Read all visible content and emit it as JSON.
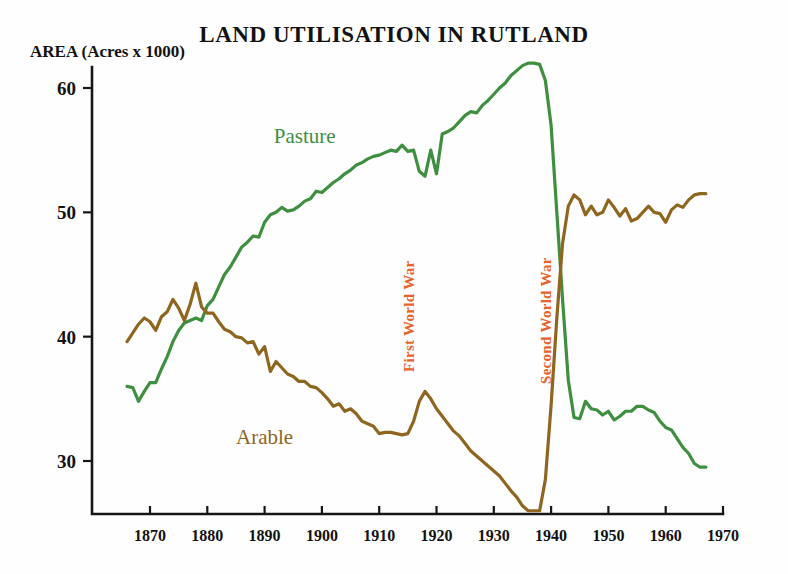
{
  "chart_data": {
    "type": "line",
    "title": "LAND UTILISATION IN RUTLAND",
    "ylabel": "AREA (Acres x 1000)",
    "xlabel": "",
    "xlim": [
      1866,
      1970
    ],
    "ylim": [
      24,
      63
    ],
    "grid": false,
    "legend_position": "inline-labels",
    "x_ticks": [
      1870,
      1880,
      1890,
      1900,
      1910,
      1920,
      1930,
      1940,
      1950,
      1960,
      1970
    ],
    "y_ticks": [
      30,
      40,
      50,
      60
    ],
    "colors": {
      "pasture": "#3e8f3f",
      "arable": "#8f6620",
      "annotation": "#e8622a",
      "axis": "#161616"
    },
    "annotations": [
      {
        "label": "First World War",
        "x": 1916,
        "orientation": "vertical"
      },
      {
        "label": "Second World War",
        "x": 1940,
        "orientation": "vertical"
      }
    ],
    "series": [
      {
        "name": "Pasture",
        "color": "#3e8f3f",
        "label_x": 1897,
        "label_y": 55.6,
        "x": [
          1866,
          1867,
          1868,
          1869,
          1870,
          1871,
          1872,
          1873,
          1874,
          1875,
          1876,
          1877,
          1878,
          1879,
          1880,
          1881,
          1882,
          1883,
          1884,
          1885,
          1886,
          1887,
          1888,
          1889,
          1890,
          1891,
          1892,
          1893,
          1894,
          1895,
          1896,
          1897,
          1898,
          1899,
          1900,
          1901,
          1902,
          1903,
          1904,
          1905,
          1906,
          1907,
          1908,
          1909,
          1910,
          1911,
          1912,
          1913,
          1914,
          1915,
          1916,
          1917,
          1918,
          1919,
          1920,
          1921,
          1922,
          1923,
          1924,
          1925,
          1926,
          1927,
          1928,
          1929,
          1930,
          1931,
          1932,
          1933,
          1934,
          1935,
          1936,
          1937,
          1938,
          1939,
          1940,
          1941,
          1942,
          1943,
          1944,
          1945,
          1946,
          1947,
          1948,
          1949,
          1950,
          1951,
          1952,
          1953,
          1954,
          1955,
          1956,
          1957,
          1958,
          1959,
          1960,
          1961,
          1962,
          1963,
          1964,
          1965,
          1966,
          1967
        ],
        "y": [
          36.0,
          35.9,
          34.8,
          35.6,
          36.3,
          36.3,
          37.4,
          38.4,
          39.6,
          40.5,
          41.1,
          41.3,
          41.5,
          41.3,
          42.5,
          43.0,
          44.0,
          45.0,
          45.6,
          46.4,
          47.2,
          47.6,
          48.1,
          48.0,
          49.2,
          49.8,
          50.0,
          50.4,
          50.1,
          50.2,
          50.5,
          50.9,
          51.1,
          51.7,
          51.6,
          52.0,
          52.4,
          52.7,
          53.1,
          53.4,
          53.8,
          54.0,
          54.3,
          54.5,
          54.6,
          54.8,
          55.0,
          54.9,
          55.4,
          54.9,
          55.0,
          53.3,
          52.9,
          55.0,
          53.1,
          56.3,
          56.5,
          56.8,
          57.3,
          57.8,
          58.1,
          58.0,
          58.6,
          59.0,
          59.5,
          60.0,
          60.4,
          61.0,
          61.4,
          61.8,
          62.0,
          62.0,
          61.9,
          60.6,
          57.0,
          50.0,
          43.0,
          36.5,
          33.5,
          33.4,
          34.8,
          34.2,
          34.1,
          33.7,
          34.0,
          33.3,
          33.6,
          34.0,
          34.0,
          34.4,
          34.4,
          34.1,
          33.9,
          33.2,
          32.7,
          32.5,
          31.8,
          31.1,
          30.6,
          29.8,
          29.5,
          29.5
        ]
      },
      {
        "name": "Arable",
        "color": "#8f6620",
        "label_x": 1890,
        "label_y": 31.4,
        "x": [
          1866,
          1867,
          1868,
          1869,
          1870,
          1871,
          1872,
          1873,
          1874,
          1875,
          1876,
          1877,
          1878,
          1879,
          1880,
          1881,
          1882,
          1883,
          1884,
          1885,
          1886,
          1887,
          1888,
          1889,
          1890,
          1891,
          1892,
          1893,
          1894,
          1895,
          1896,
          1897,
          1898,
          1899,
          1900,
          1901,
          1902,
          1903,
          1904,
          1905,
          1906,
          1907,
          1908,
          1909,
          1910,
          1911,
          1912,
          1913,
          1914,
          1915,
          1916,
          1917,
          1918,
          1919,
          1920,
          1921,
          1922,
          1923,
          1924,
          1925,
          1926,
          1927,
          1928,
          1929,
          1930,
          1931,
          1932,
          1933,
          1934,
          1935,
          1936,
          1937,
          1938,
          1939,
          1940,
          1941,
          1942,
          1943,
          1944,
          1945,
          1946,
          1947,
          1948,
          1949,
          1950,
          1951,
          1952,
          1953,
          1954,
          1955,
          1956,
          1957,
          1958,
          1959,
          1960,
          1961,
          1962,
          1963,
          1964,
          1965,
          1966,
          1967
        ],
        "y": [
          39.6,
          40.3,
          41.0,
          41.5,
          41.2,
          40.5,
          41.6,
          42.0,
          43.0,
          42.3,
          41.3,
          42.6,
          44.3,
          42.4,
          41.9,
          41.9,
          41.2,
          40.6,
          40.4,
          40.0,
          39.9,
          39.5,
          39.6,
          38.6,
          39.2,
          37.2,
          38.0,
          37.5,
          37.0,
          36.8,
          36.4,
          36.4,
          36.0,
          35.9,
          35.5,
          35.0,
          34.4,
          34.6,
          34.0,
          34.2,
          33.8,
          33.2,
          33.0,
          32.8,
          32.2,
          32.3,
          32.3,
          32.2,
          32.1,
          32.2,
          33.2,
          34.8,
          35.6,
          35.0,
          34.2,
          33.6,
          33.0,
          32.4,
          32.0,
          31.4,
          30.8,
          30.4,
          30.0,
          29.6,
          29.2,
          28.8,
          28.2,
          27.6,
          27.1,
          26.4,
          26.0,
          26.0,
          26.0,
          28.5,
          34.5,
          41.5,
          47.5,
          50.5,
          51.4,
          51.0,
          49.8,
          50.5,
          49.8,
          50.0,
          51.0,
          50.4,
          49.7,
          50.3,
          49.3,
          49.5,
          50.0,
          50.5,
          50.0,
          49.9,
          49.2,
          50.2,
          50.6,
          50.4,
          51.0,
          51.4,
          51.5,
          51.5
        ]
      }
    ]
  }
}
